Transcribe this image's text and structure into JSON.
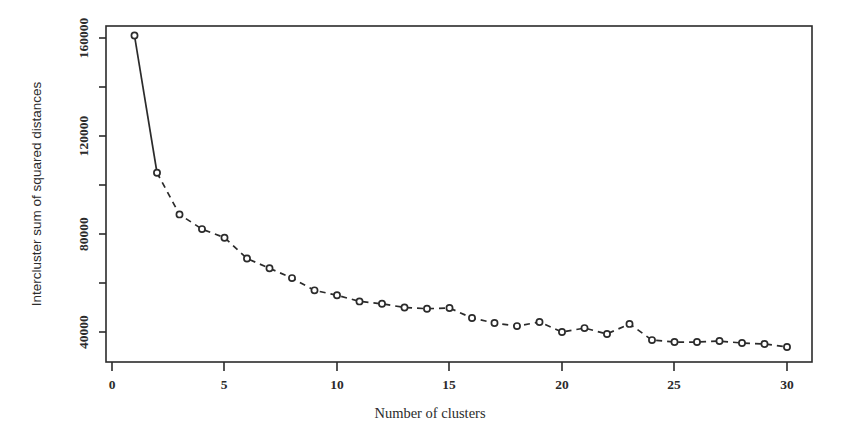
{
  "chart_data": {
    "type": "line",
    "title": "",
    "subtitle": "",
    "xlabel": "Number of clusters",
    "ylabel": "Intercluster sum of squared distances",
    "xlim": [
      0,
      31
    ],
    "ylim": [
      30000,
      170000
    ],
    "xticks": [
      0,
      5,
      10,
      15,
      20,
      25,
      30
    ],
    "xtick_labels": [
      "0",
      "5",
      "10",
      "15",
      "20",
      "25",
      "30"
    ],
    "yticks": [
      40000,
      60000,
      80000,
      100000,
      120000,
      140000,
      160000
    ],
    "ytick_labels": [
      "40000",
      "",
      "80000",
      "",
      "120000",
      "",
      "160000"
    ],
    "ytick_labels_shown": [
      "40000",
      "80000",
      "120000",
      "160000"
    ],
    "grid": false,
    "legend": false,
    "legend_position": "none",
    "marker": "open-circle",
    "line_style": "dashed-with-solid-head",
    "series": [
      {
        "name": "Intercluster sum of squared distances",
        "x": [
          1,
          2,
          3,
          4,
          5,
          6,
          7,
          8,
          9,
          10,
          11,
          12,
          13,
          14,
          15,
          16,
          17,
          18,
          19,
          20,
          21,
          22,
          23,
          24,
          25,
          26,
          27,
          28,
          29,
          30
        ],
        "values": [
          161000,
          105000,
          88000,
          82000,
          78500,
          70000,
          66000,
          62000,
          57000,
          55000,
          52500,
          51500,
          50000,
          49500,
          49800,
          45700,
          43700,
          42400,
          44100,
          40000,
          41600,
          39200,
          43300,
          36700,
          35900,
          35900,
          36300,
          35500,
          35100,
          33900
        ]
      }
    ]
  },
  "figure": {
    "axis_color": "#2b2b2b",
    "line_color": "#2b2b2b",
    "marker_fill": "#ffffff",
    "background": "#ffffff"
  }
}
